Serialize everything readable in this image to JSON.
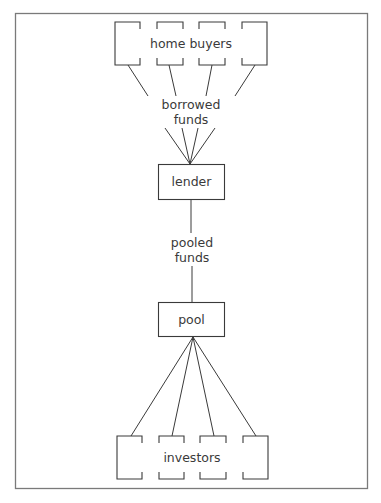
{
  "diagram": {
    "type": "flow",
    "colors": {
      "frame": "#7a7a7a",
      "stroke": "#3a3a3a",
      "text": "#3a3a3a",
      "background": "#ffffff"
    },
    "nodes": {
      "home_buyers": {
        "label": "home buyers",
        "count": 4
      },
      "lender": {
        "label": "lender"
      },
      "pool": {
        "label": "pool"
      },
      "investors": {
        "label": "investors",
        "count": 4
      }
    },
    "edges": {
      "borrowed_funds": {
        "line1": "borrowed",
        "line2": "funds",
        "from": "home_buyers",
        "to": "lender"
      },
      "pooled_funds": {
        "line1": "pooled",
        "line2": "funds",
        "from": "lender",
        "to": "pool"
      },
      "investment": {
        "from": "pool",
        "to": "investors"
      }
    }
  }
}
